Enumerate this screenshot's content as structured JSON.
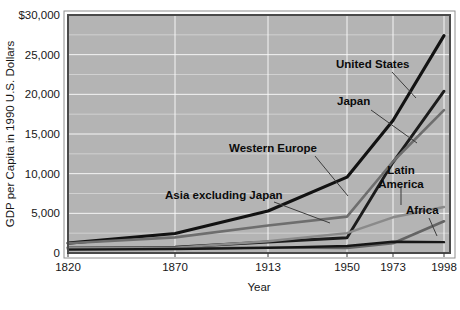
{
  "chart_data": {
    "type": "line",
    "title": "",
    "xlabel": "Year",
    "ylabel": "GDP per Capita in 1990 U.S. Dollars",
    "x": [
      1820,
      1870,
      1913,
      1950,
      1973,
      1998
    ],
    "xtick_labels": [
      "1820",
      "1870",
      "1913",
      "1950",
      "1973",
      "1998"
    ],
    "ytick_labels": [
      "0",
      "5,000",
      "10,000",
      "15,000",
      "20,000",
      "25,000",
      "$30,000"
    ],
    "ytick_values": [
      0,
      5000,
      10000,
      15000,
      20000,
      25000,
      30000
    ],
    "ylim": [
      0,
      30000
    ],
    "xlim": [
      1820,
      1998
    ],
    "grid": true,
    "legend_position": "inline-annotations",
    "plot_background": "#b4b4b4",
    "series": [
      {
        "name": "United States",
        "color": "#121212",
        "width": 3.1,
        "values": [
          1250,
          2450,
          5300,
          9560,
          16700,
          27400
        ]
      },
      {
        "name": "Japan",
        "color": "#1c1c1c",
        "width": 2.9,
        "values": [
          670,
          740,
          1390,
          1920,
          11430,
          20400
        ]
      },
      {
        "name": "Western Europe",
        "color": "#6e6e6e",
        "width": 2.6,
        "values": [
          1230,
          1970,
          3470,
          4580,
          11530,
          18000
        ]
      },
      {
        "name": "Asia excluding Japan",
        "color": "#646464",
        "width": 2.6,
        "values": [
          580,
          560,
          700,
          640,
          1230,
          4000
        ]
      },
      {
        "name": "Latin America",
        "color": "#8a8a8a",
        "width": 2.4,
        "values": [
          690,
          680,
          1480,
          2500,
          4500,
          5800
        ]
      },
      {
        "name": "Africa",
        "color": "#161616",
        "width": 2.4,
        "values": [
          420,
          500,
          640,
          890,
          1410,
          1370
        ]
      }
    ],
    "annotations": [
      {
        "label": "United States",
        "x": 336,
        "y": 68,
        "anchor": "start",
        "leader": [
          [
            392,
            72
          ],
          [
            416,
            98
          ]
        ]
      },
      {
        "label": "Japan",
        "x": 337,
        "y": 105,
        "anchor": "start",
        "leader": [
          [
            371,
            110
          ],
          [
            417,
            143
          ]
        ]
      },
      {
        "label": "Western Europe",
        "x": 229,
        "y": 152,
        "anchor": "start",
        "leader": [
          [
            315,
            156
          ],
          [
            348,
            196
          ]
        ]
      },
      {
        "label": "Asia excluding Japan",
        "x": 165,
        "y": 199,
        "anchor": "start",
        "leader": [
          [
            274,
            202
          ],
          [
            330,
            223
          ]
        ]
      },
      {
        "label": "Latin America",
        "x": 401,
        "y": 174,
        "anchor": "middle",
        "leader": [
          [
            401,
            186
          ],
          [
            401,
            205
          ]
        ],
        "line2": "America",
        "line1": "Latin"
      },
      {
        "label": "Africa",
        "x": 406,
        "y": 214,
        "anchor": "start",
        "leader": [
          [
            429,
            218
          ],
          [
            437,
            236
          ]
        ]
      }
    ]
  }
}
